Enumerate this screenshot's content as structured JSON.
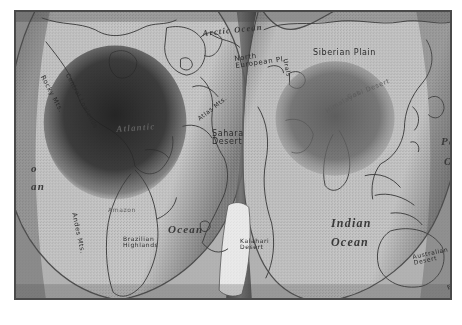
{
  "map": {
    "title": "Interrupted world map (Goode homolosine projection), grayscale",
    "projection": "goode-homolosine-interrupted",
    "frame_color": "#4a4a4a",
    "ocean_color": "#b6b6b6",
    "land_color": "#c8c8c8",
    "shadow_color": "#2a2a2a",
    "lobes": [
      {
        "name": "western-lobe",
        "contains": "Americas, Atlantic, Africa"
      },
      {
        "name": "eastern-lobe",
        "contains": "Eurasia, Indian Ocean, Australia"
      }
    ],
    "labels": [
      {
        "id": "arctic-ocean",
        "text": "Arctic Ocean",
        "x": 186,
        "y": 16,
        "size": 8.5,
        "rotate": -6,
        "style": "ocean"
      },
      {
        "id": "rocky-mts",
        "text": "Rocky Mts.",
        "x": 30,
        "y": 62,
        "size": 6.5,
        "rotate": 62,
        "style": "plain"
      },
      {
        "id": "central-lowlands",
        "text": "Central Lowlands",
        "x": 55,
        "y": 60,
        "size": 6,
        "rotate": 62,
        "style": "plain"
      },
      {
        "id": "north-european-plain",
        "text": "North\nEuropean Pl.",
        "x": 218,
        "y": 44,
        "size": 7,
        "rotate": -8,
        "style": "plain"
      },
      {
        "id": "siberian-plain",
        "text": "Siberian Plain",
        "x": 297,
        "y": 36,
        "size": 8,
        "rotate": 0,
        "style": "plain"
      },
      {
        "id": "atlas-mts",
        "text": "Atlas Mts.",
        "x": 180,
        "y": 104,
        "size": 6,
        "rotate": -38,
        "style": "plain"
      },
      {
        "id": "sahara-desert",
        "text": "Sahara\nDesert",
        "x": 196,
        "y": 118,
        "size": 8,
        "rotate": 0,
        "style": "plain"
      },
      {
        "id": "atlantic-ocean",
        "text": "Atlantic",
        "x": 100,
        "y": 112,
        "size": 9,
        "rotate": -4,
        "style": "ocean onDark"
      },
      {
        "id": "atlantic-ocean-word",
        "text": "Ocean",
        "x": 152,
        "y": 211,
        "size": 11,
        "rotate": 0,
        "style": "ocean"
      },
      {
        "id": "himalayas",
        "text": "Himalayas",
        "x": 308,
        "y": 96,
        "size": 6.5,
        "rotate": -30,
        "style": "onDark"
      },
      {
        "id": "gobi-desert",
        "text": "Gobi Desert",
        "x": 330,
        "y": 82,
        "size": 6.5,
        "rotate": -22,
        "style": "onDark"
      },
      {
        "id": "andes-mts",
        "text": "Andes Mts.",
        "x": 62,
        "y": 200,
        "size": 6.5,
        "rotate": 78,
        "style": "plain"
      },
      {
        "id": "brazilian-highlands",
        "text": "Brazilian\nHighlands",
        "x": 107,
        "y": 224,
        "size": 6,
        "rotate": 0,
        "style": "plain"
      },
      {
        "id": "amazon-basin",
        "text": "Amazon",
        "x": 92,
        "y": 194,
        "size": 6,
        "rotate": 0,
        "style": "onDark"
      },
      {
        "id": "kalahari-desert",
        "text": "Kalahari\nDesert",
        "x": 224,
        "y": 226,
        "size": 6,
        "rotate": 0,
        "style": "plain"
      },
      {
        "id": "indian-ocean",
        "text": "Indian",
        "x": 315,
        "y": 204,
        "size": 12,
        "rotate": 0,
        "style": "ocean"
      },
      {
        "id": "indian-ocean-word",
        "text": "Ocean",
        "x": 315,
        "y": 223,
        "size": 12,
        "rotate": 0,
        "style": "ocean"
      },
      {
        "id": "pacific-ocean-right",
        "text": "Pa",
        "x": 425,
        "y": 123,
        "size": 11,
        "rotate": 0,
        "style": "ocean"
      },
      {
        "id": "pacific-ocean-right2",
        "text": "O",
        "x": 428,
        "y": 143,
        "size": 11,
        "rotate": 0,
        "style": "ocean"
      },
      {
        "id": "pacific-ocean-left",
        "text": "o",
        "x": 15,
        "y": 150,
        "size": 11,
        "rotate": 0,
        "style": "ocean"
      },
      {
        "id": "pacific-ocean-left2",
        "text": "an",
        "x": 15,
        "y": 168,
        "size": 11,
        "rotate": 0,
        "style": "ocean"
      },
      {
        "id": "australian-desert",
        "text": "Australian\nDesert",
        "x": 396,
        "y": 242,
        "size": 6,
        "rotate": -12,
        "style": "plain"
      },
      {
        "id": "east-australia",
        "text": "Eas",
        "x": 430,
        "y": 272,
        "size": 6,
        "rotate": -20,
        "style": "plain"
      },
      {
        "id": "ural-mts",
        "text": "Urals",
        "x": 273,
        "y": 46,
        "size": 6,
        "rotate": 78,
        "style": "plain"
      }
    ]
  }
}
